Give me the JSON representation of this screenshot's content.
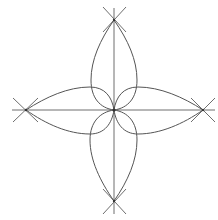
{
  "diagram": {
    "canvas": {
      "width": 218,
      "height": 220,
      "background": "#ffffff"
    },
    "center": [
      114,
      110
    ],
    "tips": {
      "top": [
        114,
        20
      ],
      "bottom": [
        114,
        201
      ],
      "left": [
        26,
        110
      ],
      "right": [
        203,
        110
      ]
    },
    "stroke_color": "#555555",
    "axis_color": "#6e6e6e"
  }
}
